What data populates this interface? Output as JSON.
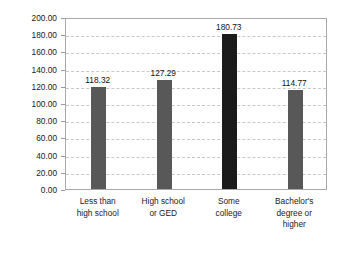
{
  "chart_data": {
    "type": "bar",
    "title": "",
    "subtitle": "",
    "xlabel": "",
    "ylabel": "Episodes per 1,000 population",
    "categories": [
      "Less than\nhigh school",
      "High school\nor GED",
      "Some\ncollege",
      "Bachelor's\ndegree or\nhigher"
    ],
    "values": [
      118.32,
      127.29,
      180.73,
      114.77
    ],
    "value_labels": [
      "118.32",
      "127.29",
      "180.73",
      "114.77"
    ],
    "bar_colors": [
      "#585858",
      "#585858",
      "#1b1b1b",
      "#585858"
    ],
    "ylim": [
      0,
      200
    ],
    "ytick_step": 20,
    "ytick_labels": [
      "200.00",
      "180.00",
      "160.00",
      "140.00",
      "120.00",
      "100.00",
      "80.00",
      "60.00",
      "40.00",
      "20.00",
      "0.00"
    ],
    "ytick_values": [
      200,
      180,
      160,
      140,
      120,
      100,
      80,
      60,
      40,
      20,
      0
    ],
    "grid": true,
    "grid_axis": "y",
    "grid_style": "dashed",
    "grid_color": "#c9c9c9",
    "legend": false,
    "legend_position": "none",
    "frame_color": "#a8a8a8",
    "background_color": "#ffffff",
    "text_color": "#1a1a1a"
  }
}
